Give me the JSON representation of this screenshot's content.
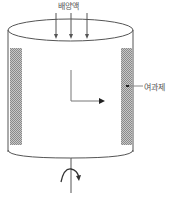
{
  "diagram": {
    "title": "",
    "labels": {
      "culture_medium": "배양액",
      "filter_agent": "여과제"
    },
    "elements": {
      "vessel": "cylinder",
      "inflow_arrows": 3,
      "flow_direction": "radial outward (L-shaped arrow)",
      "rotation": "shaft with curved rotation arrow"
    },
    "colors": {
      "line": "#555555",
      "hatch": "#9a9a9a",
      "background": "#ffffff"
    }
  }
}
